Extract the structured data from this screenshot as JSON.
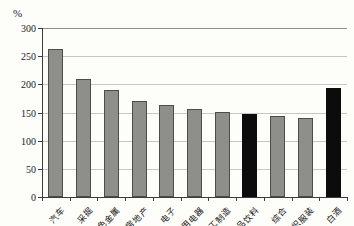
{
  "chart_data": {
    "type": "bar",
    "title": "",
    "xlabel": "",
    "ylabel": "",
    "unit_label": "%",
    "categories": [
      "汽车",
      "采掘",
      "有色金属",
      "房地产",
      "电子",
      "家用电器",
      "轻工制造",
      "食品饮料",
      "综合",
      "纺织服装",
      "白酒"
    ],
    "values": [
      262,
      210,
      190,
      170,
      164,
      156,
      151,
      148,
      143,
      140,
      194
    ],
    "highlight_indices": [
      7,
      10
    ],
    "highlighted_categories": [
      "食品饮料",
      "白酒"
    ],
    "yticks": [
      0,
      50,
      100,
      150,
      200,
      250,
      300
    ],
    "ylim": [
      0,
      300
    ],
    "grid": true,
    "legend": false,
    "colors": {
      "bar_fill": "#8e8e8b",
      "bar_border": "#4c4c49",
      "highlight_fill": "#0c0c0c",
      "gridline": "#c6c6c2",
      "axis": "#3c3c3a",
      "background": "#fdfdfa"
    }
  }
}
